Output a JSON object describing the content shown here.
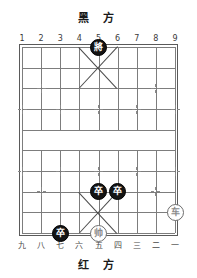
{
  "board": {
    "black_side_label": "黑 方",
    "red_side_label": "红 方",
    "top_files": [
      "1",
      "2",
      "3",
      "4",
      "5",
      "6",
      "7",
      "8",
      "9"
    ],
    "bottom_files": [
      "九",
      "八",
      "七",
      "六",
      "五",
      "四",
      "三",
      "二",
      "一"
    ],
    "files": 9,
    "ranks": 10,
    "colors": {
      "black_piece_fill": "#141414",
      "black_piece_text": "#ffffff",
      "red_piece_fill": "#ffffff",
      "red_piece_text": "#8a8a8a",
      "grid_line": "#7d7d7d",
      "border": "#5a5a5a",
      "background": "#ffffff"
    }
  },
  "pieces": [
    {
      "name": "black-general",
      "glyph": "將",
      "side": "black",
      "file": 5,
      "rank": 0
    },
    {
      "name": "black-pawn-1",
      "glyph": "卒",
      "side": "black",
      "file": 5,
      "rank": 7
    },
    {
      "name": "black-pawn-2",
      "glyph": "卒",
      "side": "black",
      "file": 6,
      "rank": 7
    },
    {
      "name": "black-pawn-3",
      "glyph": "卒",
      "side": "black",
      "file": 3,
      "rank": 9
    },
    {
      "name": "red-marshal",
      "glyph": "帅",
      "side": "red",
      "file": 5,
      "rank": 9
    },
    {
      "name": "red-chariot",
      "glyph": "车",
      "side": "red",
      "file": 9,
      "rank": 8
    }
  ],
  "markers": [
    {
      "file": 2,
      "rank": 2
    },
    {
      "file": 8,
      "rank": 2
    },
    {
      "file": 1,
      "rank": 3
    },
    {
      "file": 3,
      "rank": 3
    },
    {
      "file": 5,
      "rank": 3
    },
    {
      "file": 7,
      "rank": 3
    },
    {
      "file": 9,
      "rank": 3
    },
    {
      "file": 1,
      "rank": 6
    },
    {
      "file": 3,
      "rank": 6
    },
    {
      "file": 5,
      "rank": 6
    },
    {
      "file": 7,
      "rank": 6
    },
    {
      "file": 9,
      "rank": 6
    },
    {
      "file": 2,
      "rank": 7
    },
    {
      "file": 8,
      "rank": 7
    }
  ],
  "palaces": [
    {
      "name": "black-palace",
      "top_rank": 0,
      "bottom_rank": 2
    },
    {
      "name": "red-palace",
      "top_rank": 7,
      "bottom_rank": 9
    }
  ]
}
